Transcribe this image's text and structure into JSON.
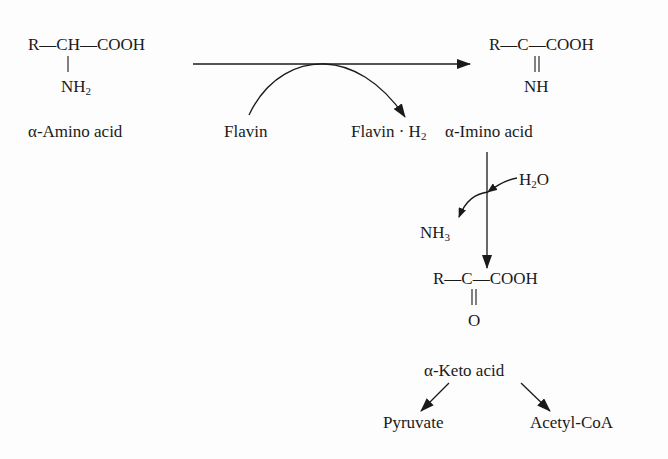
{
  "diagram": {
    "amino_acid": {
      "formula_main": "R—CH—COOH",
      "substituent": "NH",
      "substituent_sub": "2",
      "label": "α-Amino acid"
    },
    "imino_acid": {
      "formula_main": "R—C—COOH",
      "substituent": "NH",
      "label": "α-Imino acid"
    },
    "cofactor": {
      "reactant": "Flavin",
      "product_prefix": "Flavin · H",
      "product_sub": "2"
    },
    "hydrolysis": {
      "water": "H",
      "water_sub": "2",
      "water_suffix": "O",
      "ammonia": "NH",
      "ammonia_sub": "3"
    },
    "keto_acid": {
      "formula_main": "R—C—COOH",
      "substituent": "O",
      "label": "α-Keto acid"
    },
    "products": {
      "left": "Pyruvate",
      "right": "Acetyl-CoA"
    },
    "colors": {
      "ink": "#1a1a1a",
      "background": "#fdfdfd"
    }
  }
}
